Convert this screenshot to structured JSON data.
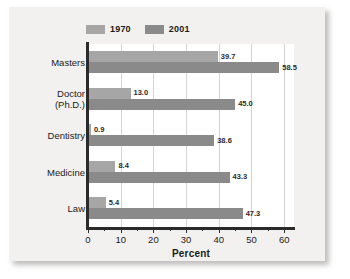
{
  "chart_data": {
    "type": "bar",
    "orientation": "horizontal",
    "title": "",
    "xlabel": "Percent",
    "ylabel": "Degree and field of study",
    "categories": [
      "Masters",
      "Doctor (Ph.D.)",
      "Dentistry",
      "Medicine",
      "Law"
    ],
    "category_lines": [
      [
        "Masters"
      ],
      [
        "Doctor",
        "(Ph.D.)"
      ],
      [
        "Dentistry"
      ],
      [
        "Medicine"
      ],
      [
        "Law"
      ]
    ],
    "series": [
      {
        "name": "1970",
        "color": "#a6a6a6",
        "values": [
          39.7,
          13.0,
          0.9,
          8.4,
          5.4
        ],
        "labels": [
          "39.7",
          "13.0",
          "0.9",
          "8.4",
          "5.4"
        ]
      },
      {
        "name": "2001",
        "color": "#8a8a8a",
        "values": [
          58.5,
          45.0,
          38.6,
          43.3,
          47.3
        ],
        "labels": [
          "58.5",
          "45.0",
          "38.6",
          "43.3",
          "47.3"
        ]
      }
    ],
    "xlim": [
      0,
      63
    ],
    "xticks": [
      0,
      10,
      20,
      30,
      40,
      50,
      60
    ],
    "xtick_labels": [
      "0",
      "10",
      "20",
      "30",
      "40",
      "50",
      "60"
    ],
    "xminor_ticks": [
      5,
      15,
      25,
      35,
      45,
      55
    ],
    "grid": "vertical",
    "legend_position": "top-left",
    "legend": [
      "1970",
      "2001"
    ]
  },
  "colors": {
    "series_1970": "#a6a6a6",
    "series_2001": "#8a8a8a",
    "axis": "#2b2b2b",
    "gridline": "#d6d4d1",
    "panel_background": "#f2f1ef",
    "plot_background": "#ffffff",
    "text": "#1a1a1a"
  }
}
